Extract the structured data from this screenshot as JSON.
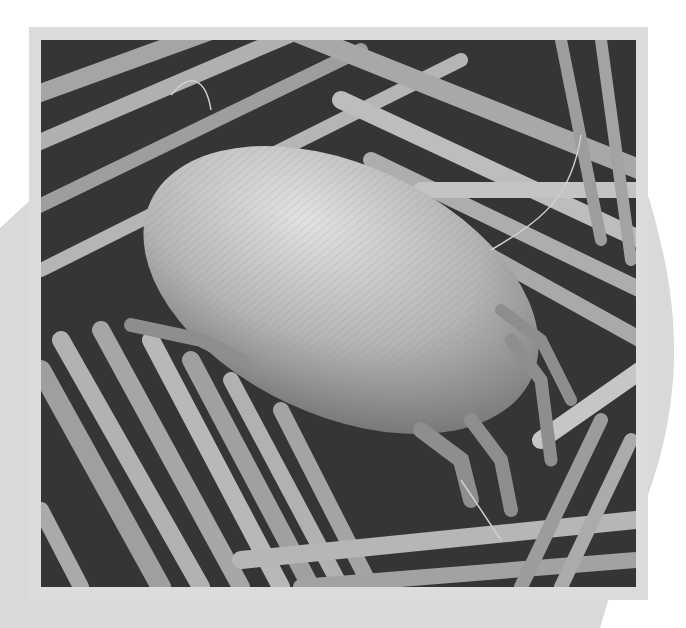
{
  "image": {
    "subject": "Scanning electron micrograph of a dust mite resting on textile fibers",
    "alt": "Grayscale SEM image of an oval dust mite with striated cuticle and jointed legs on a bed of fibers",
    "colors": {
      "background": "#ffffff",
      "backdrop_shape": "#d9d9d9",
      "frame": "#dcdcdc",
      "photo_dark": "#2b2b2b",
      "photo_mid": "#8a8a8a",
      "photo_light": "#d0d0d0"
    }
  }
}
